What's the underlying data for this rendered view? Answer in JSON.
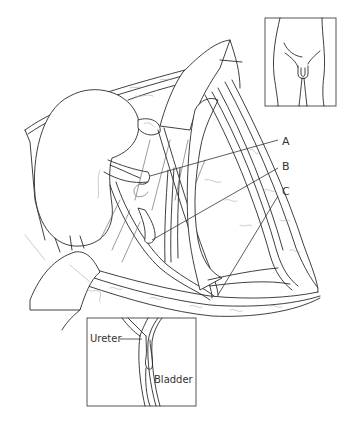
{
  "figure": {
    "type": "anatomical-illustration",
    "callouts": [
      {
        "id": "A",
        "label": "A"
      },
      {
        "id": "B",
        "label": "B"
      },
      {
        "id": "C",
        "label": "C"
      }
    ],
    "orientation_inset": {
      "description": "lower torso orientation sketch"
    },
    "detail_inset": {
      "labels": {
        "ureter": "Ureter",
        "bladder": "Bladder"
      }
    }
  },
  "colors": {
    "line": "#2a2a2a",
    "faint_line": "#a8a8a8",
    "background": "#ffffff"
  }
}
